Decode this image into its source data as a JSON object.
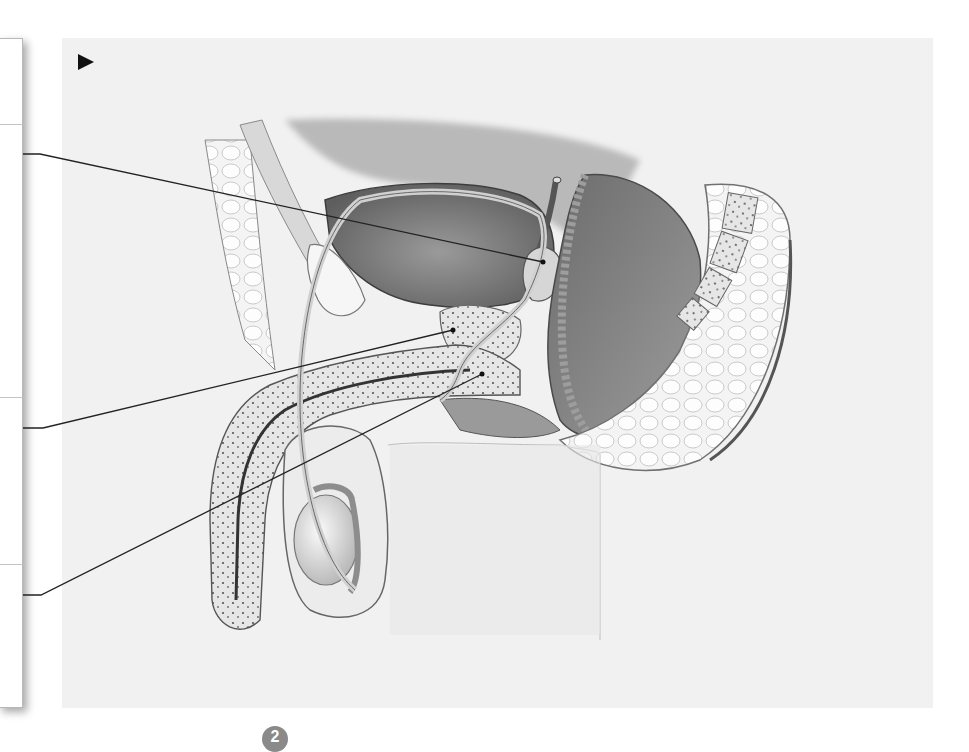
{
  "figure": {
    "play_marker": "play-triangle-icon",
    "background_color": "#f1f1f1",
    "line_color": "#222222"
  },
  "label_panel": {
    "slots": [
      {
        "id": "slot-0",
        "text": "",
        "top": 0,
        "height": 86
      },
      {
        "id": "slot-1",
        "text": "",
        "top": 86,
        "height": 273
      },
      {
        "id": "slot-2",
        "text": "",
        "top": 359,
        "height": 167
      },
      {
        "id": "slot-3",
        "text": "",
        "top": 526,
        "height": 144
      }
    ]
  },
  "leaders": [
    {
      "id": "leader-seminal-vesicle",
      "start": [
        23,
        154
      ],
      "kink": [
        40,
        154
      ],
      "end": [
        543,
        262
      ]
    },
    {
      "id": "leader-prostate",
      "start": [
        23,
        428
      ],
      "kink": [
        43,
        428
      ],
      "end": [
        453,
        330
      ]
    },
    {
      "id": "leader-bulbourethral-gland",
      "start": [
        23,
        595
      ],
      "kink": [
        41,
        595
      ],
      "end": [
        482,
        374
      ]
    }
  ],
  "footer": {
    "badge_text": "2"
  }
}
